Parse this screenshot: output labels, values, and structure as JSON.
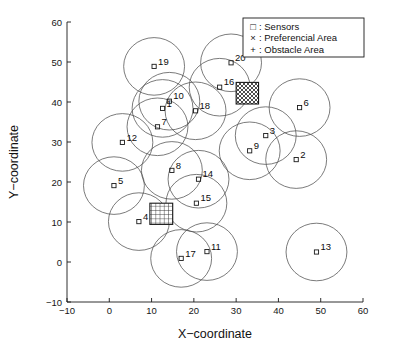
{
  "chart_data": {
    "type": "scatter",
    "title": "",
    "xlabel": "X−coordinate",
    "ylabel": "Y−coordinate",
    "xlim": [
      -10,
      60
    ],
    "ylim": [
      -10,
      60
    ],
    "xticks": [
      "−10",
      "0",
      "10",
      "20",
      "30",
      "40",
      "50",
      "60"
    ],
    "yticks": [
      "−10",
      "0",
      "10",
      "20",
      "30",
      "40",
      "50",
      "60"
    ],
    "xtick_values": [
      -10,
      0,
      10,
      20,
      30,
      40,
      50,
      60
    ],
    "ytick_values": [
      -10,
      0,
      10,
      20,
      30,
      40,
      50,
      60
    ],
    "grid": false,
    "legend_position": "top-right",
    "legend": [
      {
        "symbol": "□",
        "label": ": Sensors",
        "name": "sensors"
      },
      {
        "symbol": "×",
        "label": ": Preferencial Area",
        "name": "preferencial-area"
      },
      {
        "symbol": "+",
        "label": ": Obstacle Area",
        "name": "obstacle-area"
      }
    ],
    "series": [
      {
        "name": "Sensors",
        "marker": "square",
        "coverage_radius": 7.2,
        "points": [
          {
            "label": "1",
            "x": 12.6,
            "y": 38.4,
            "label_dx": 2.0,
            "label_dy": 1.2,
            "r": 7.2
          },
          {
            "label": "2",
            "x": 44.2,
            "y": 25.6,
            "label_dx": 2.0,
            "label_dy": 1.2,
            "r": 7.2
          },
          {
            "label": "3",
            "x": 37.0,
            "y": 31.6,
            "label_dx": 2.0,
            "label_dy": 1.2,
            "r": 7.2
          },
          {
            "label": "4",
            "x": 7.0,
            "y": 10.1,
            "label_dx": 2.0,
            "label_dy": 1.2,
            "r": 7.2
          },
          {
            "label": "5",
            "x": 1.1,
            "y": 19.1,
            "label_dx": 2.0,
            "label_dy": 1.2,
            "r": 7.2
          },
          {
            "label": "6",
            "x": 45.0,
            "y": 38.6,
            "label_dx": 2.0,
            "label_dy": 1.2,
            "r": 7.2
          },
          {
            "label": "7",
            "x": 11.4,
            "y": 33.8,
            "label_dx": 2.0,
            "label_dy": 1.2,
            "r": 7.2
          },
          {
            "label": "8",
            "x": 14.8,
            "y": 22.9,
            "label_dx": 2.0,
            "label_dy": 1.2,
            "r": 7.2
          },
          {
            "label": "9",
            "x": 33.2,
            "y": 27.8,
            "label_dx": 2.0,
            "label_dy": 1.2,
            "r": 7.2
          },
          {
            "label": "10",
            "x": 14.2,
            "y": 40.2,
            "label_dx": 2.0,
            "label_dy": 1.2,
            "r": 7.2
          },
          {
            "label": "11",
            "x": 23.1,
            "y": 2.6,
            "label_dx": 2.0,
            "label_dy": 1.2,
            "r": 7.2
          },
          {
            "label": "12",
            "x": 3.1,
            "y": 29.9,
            "label_dx": 2.0,
            "label_dy": 1.2,
            "r": 7.2
          },
          {
            "label": "13",
            "x": 49.0,
            "y": 2.5,
            "label_dx": 2.0,
            "label_dy": 1.2,
            "r": 7.2
          },
          {
            "label": "14",
            "x": 21.1,
            "y": 20.7,
            "label_dx": 2.0,
            "label_dy": 1.2,
            "r": 7.2
          },
          {
            "label": "15",
            "x": 20.6,
            "y": 14.7,
            "label_dx": 2.0,
            "label_dy": 1.2,
            "r": 7.2
          },
          {
            "label": "16",
            "x": 26.1,
            "y": 43.7,
            "label_dx": 2.0,
            "label_dy": 1.2,
            "r": 7.2
          },
          {
            "label": "17",
            "x": 17.0,
            "y": 0.9,
            "label_dx": 2.0,
            "label_dy": 1.2,
            "r": 7.2
          },
          {
            "label": "18",
            "x": 20.4,
            "y": 37.8,
            "label_dx": 2.0,
            "label_dy": 1.2,
            "r": 7.2
          },
          {
            "label": "19",
            "x": 10.6,
            "y": 48.9,
            "label_dx": 2.0,
            "label_dy": 1.2,
            "r": 7.2
          },
          {
            "label": "20",
            "x": 28.8,
            "y": 49.8,
            "label_dx": 2.0,
            "label_dy": 1.2,
            "r": 7.2
          }
        ]
      }
    ],
    "areas": [
      {
        "name": "preferencial-area",
        "kind": "preferencial",
        "hatch": "cross",
        "x0": 30.0,
        "y0": 39.5,
        "x1": 35.3,
        "y1": 44.9
      },
      {
        "name": "obstacle-area",
        "kind": "obstacle",
        "hatch": "grid",
        "x0": 9.6,
        "y0": 9.4,
        "x1": 15.0,
        "y1": 14.7
      }
    ]
  }
}
